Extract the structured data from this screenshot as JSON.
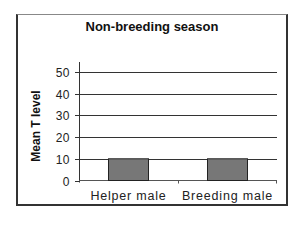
{
  "chart_data": {
    "type": "bar",
    "title": "Non-breeding season",
    "xlabel": "",
    "ylabel": "Mean T level",
    "categories": [
      "Helper male",
      "Breeding male"
    ],
    "values": [
      10,
      10
    ],
    "yticks": [
      0,
      10,
      20,
      30,
      40,
      50
    ],
    "ylim": [
      0,
      50
    ],
    "grid": true,
    "legend": null,
    "bar_color": "#777777"
  }
}
